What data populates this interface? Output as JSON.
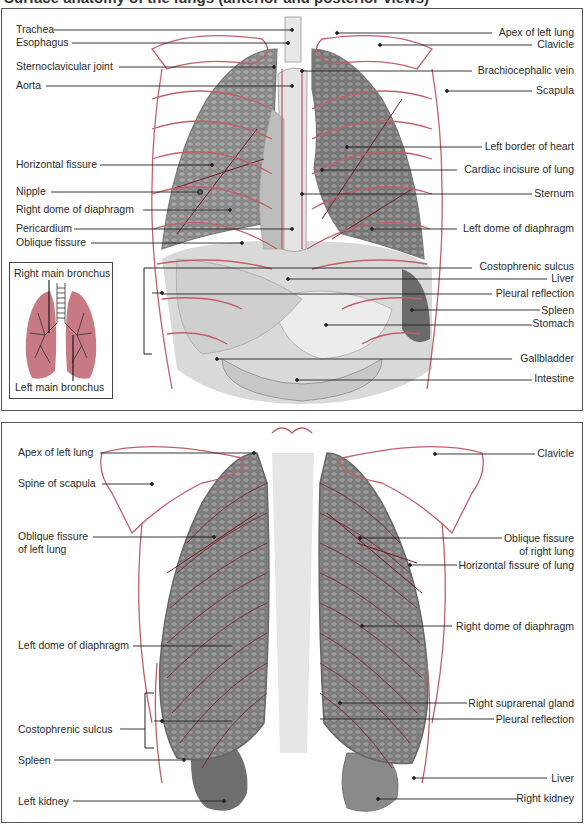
{
  "title_partial": "Surface anatomy of the lungs (anterior and posterior views)",
  "colors": {
    "rib_outline": "#c0606a",
    "lung_gray": "#8a8a8a",
    "lung_dark": "#6e6e6e",
    "fissure_red": "#7a1a22",
    "inset_lung_pink": "#c87a84",
    "leader_line": "#222222",
    "panel_border": "#555555"
  },
  "front_view": {
    "left_labels": [
      {
        "text": "Trachea",
        "y": 21
      },
      {
        "text": "Esophagus",
        "y": 34
      },
      {
        "text": "Sternoclavicular joint",
        "y": 58
      },
      {
        "text": "Aorta",
        "y": 77
      },
      {
        "text": "Horizontal fissure",
        "y": 156
      },
      {
        "text": "Nipple",
        "y": 183
      },
      {
        "text": "Right dome of diaphragm",
        "y": 201
      },
      {
        "text": "Pericardium",
        "y": 220
      },
      {
        "text": "Oblique fissure",
        "y": 234
      }
    ],
    "right_labels": [
      {
        "text": "Apex of left lung",
        "y": 24
      },
      {
        "text": "Clavicle",
        "y": 36
      },
      {
        "text": "Brachiocephalic vein",
        "y": 62
      },
      {
        "text": "Scapula",
        "y": 82
      },
      {
        "text": "Left border of heart",
        "y": 138
      },
      {
        "text": "Cardiac incisure of lung",
        "y": 161
      },
      {
        "text": "Sternum",
        "y": 185
      },
      {
        "text": "Left dome of diaphragm",
        "y": 220
      },
      {
        "text": "Costophrenic sulcus",
        "y": 256
      },
      {
        "text": "Liver",
        "y": 268
      },
      {
        "text": "Pleural reflection",
        "y": 284
      },
      {
        "text": "Spleen",
        "y": 301
      },
      {
        "text": "Stomach",
        "y": 314
      },
      {
        "text": "Gallbladder",
        "y": 348
      },
      {
        "text": "Intestine",
        "y": 368
      }
    ],
    "inset": {
      "top_label": "Right main bronchus",
      "bottom_label": "Left main bronchus"
    }
  },
  "back_view": {
    "left_labels": [
      {
        "text": "Apex of left lung",
        "y": 29
      },
      {
        "text": "Spine of scapula",
        "y": 60
      },
      {
        "text": "Oblique fissure",
        "y": 111
      },
      {
        "text": "of left lung",
        "y": 124
      },
      {
        "text": "Left dome of diaphragm",
        "y": 222
      },
      {
        "text": "Costophrenic sulcus",
        "y": 305
      },
      {
        "text": "Spleen",
        "y": 336
      },
      {
        "text": "Left kidney",
        "y": 377
      }
    ],
    "right_labels": [
      {
        "text": "Clavicle",
        "y": 30
      },
      {
        "text": "Oblique fissure",
        "y": 115
      },
      {
        "text": "of right lung",
        "y": 128
      },
      {
        "text": "Horizontal fissure of lung",
        "y": 141
      },
      {
        "text": "Right dome of diaphragm",
        "y": 203
      },
      {
        "text": "Right suprarenal gland",
        "y": 280
      },
      {
        "text": "Pleural reflection",
        "y": 295
      },
      {
        "text": "Liver",
        "y": 355
      },
      {
        "text": "Right kidney",
        "y": 375
      }
    ]
  }
}
